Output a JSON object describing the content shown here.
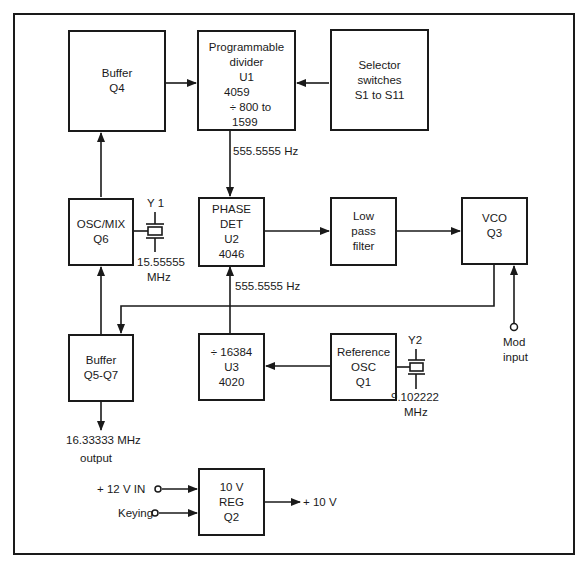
{
  "diagram": {
    "title": "",
    "blocks": {
      "buffer_q4": {
        "lines": [
          "Buffer",
          "Q4"
        ]
      },
      "prog_divider": {
        "lines": [
          "Programmable",
          "divider",
          "U1",
          "4059",
          "÷  800 to",
          "1599"
        ]
      },
      "selector": {
        "lines": [
          "Selector",
          "switches",
          "S1 to S11"
        ]
      },
      "osc_mix": {
        "lines": [
          "OSC/MIX",
          "Q6"
        ]
      },
      "phase_det": {
        "lines": [
          "PHASE",
          "DET",
          "U2",
          "4046"
        ]
      },
      "lpf": {
        "lines": [
          "Low",
          "pass",
          "filter"
        ]
      },
      "vco": {
        "lines": [
          "VCO",
          "Q3"
        ]
      },
      "buffer_q5q7": {
        "lines": [
          "Buffer",
          "Q5-Q7"
        ]
      },
      "div16384": {
        "lines": [
          "÷  16384",
          "U3",
          "4020"
        ]
      },
      "ref_osc": {
        "lines": [
          "Reference",
          "OSC",
          "Q1"
        ]
      },
      "reg10v": {
        "lines": [
          "10 V",
          "REG",
          "Q2"
        ]
      }
    },
    "labels": {
      "freq_div_out": "555.5555 Hz",
      "freq_ref_out": "555.5555 Hz",
      "y1_name": "Y 1",
      "y1_freq": "15.55555",
      "y1_unit": "MHz",
      "y2_name": "Y2",
      "y2_freq": "9.102222",
      "y2_unit": "MHz",
      "mod_input_1": "Mod",
      "mod_input_2": "input",
      "output_freq": "16.33333 MHz",
      "output_word": "output",
      "v12_in": "+ 12 V  IN",
      "keying": "Keying",
      "v10_out": "+ 10 V"
    },
    "colors": {
      "ink": "#1a1a1a",
      "paper": "#ffffff"
    }
  }
}
